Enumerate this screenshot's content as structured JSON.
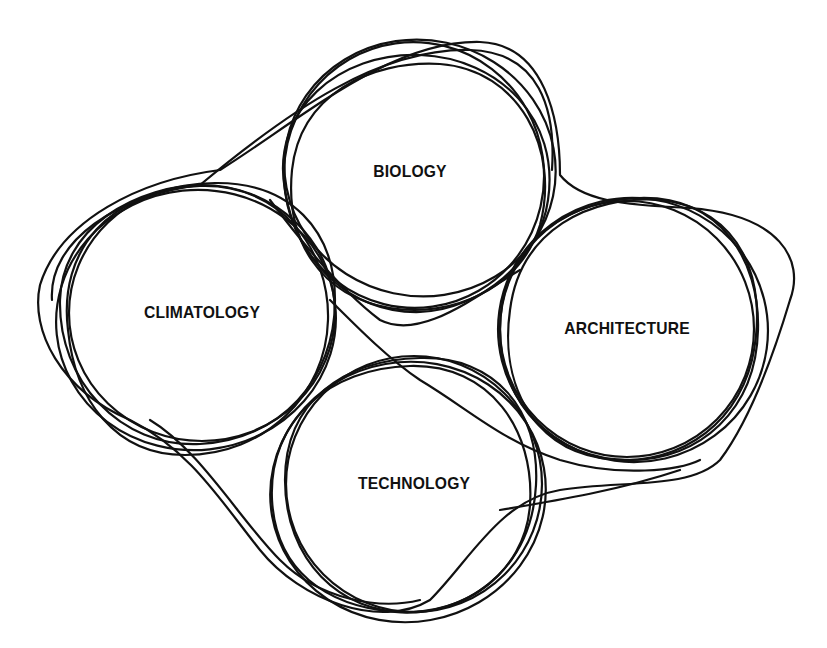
{
  "diagram": {
    "type": "hand-drawn overlapping circles",
    "stroke_color": "#111111",
    "background": "#ffffff",
    "nodes": [
      {
        "id": "biology",
        "label": "BIOLOGY",
        "cx": 410,
        "cy": 172
      },
      {
        "id": "climatology",
        "label": "CLIMATOLOGY",
        "cx": 202,
        "cy": 313
      },
      {
        "id": "architecture",
        "label": "ARCHITECTURE",
        "cx": 627,
        "cy": 329
      },
      {
        "id": "technology",
        "label": "TECHNOLOGY",
        "cx": 414,
        "cy": 484
      }
    ]
  }
}
